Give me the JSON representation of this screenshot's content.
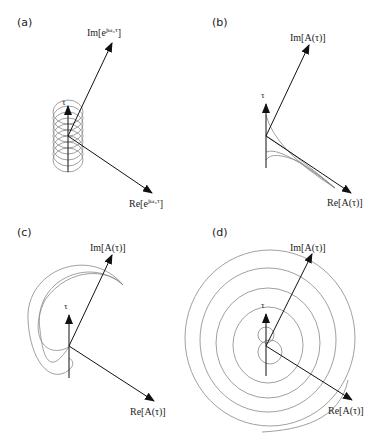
{
  "figure": {
    "panels": [
      {
        "id": "a",
        "label": "(a)",
        "im_label": "Im[e^{jω₀τ}]",
        "re_label": "Re[e^{jω₀τ}]",
        "tau_label": "τ",
        "curve": "helix"
      },
      {
        "id": "b",
        "label": "(b)",
        "im_label": "Im[A(τ)]",
        "re_label": "Re[A(τ)]",
        "tau_label": "τ",
        "curve": "decaying-lines"
      },
      {
        "id": "c",
        "label": "(c)",
        "im_label": "Im[A(τ)]",
        "re_label": "Re[A(τ)]",
        "tau_label": "τ",
        "curve": "crescent-spiral"
      },
      {
        "id": "d",
        "label": "(d)",
        "im_label": "Im[A(τ)]",
        "re_label": "Re[A(τ)]",
        "tau_label": "τ",
        "curve": "expanding-spiral"
      }
    ],
    "labels": {
      "a_im": "Im[e",
      "a_re": "Re[e",
      "a_sup": "jω₀τ",
      "im": "Im[A(τ)]",
      "re": "Re[A(τ)]",
      "tau": "τ"
    },
    "colors": {
      "axis": "#111111",
      "curve": "#888888",
      "background": "#ffffff"
    }
  }
}
